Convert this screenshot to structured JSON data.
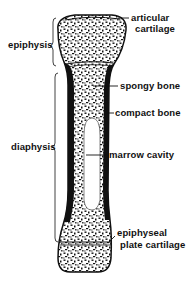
{
  "diagram": {
    "title": "",
    "colors": {
      "ink": "#111111",
      "background": "#ffffff"
    },
    "left_labels": [
      {
        "id": "epiphysis",
        "text": "epiphysis"
      },
      {
        "id": "diaphysis",
        "text": "diaphysis"
      }
    ],
    "right_labels": {
      "articular_1": "articular",
      "articular_2": "cartilage",
      "spongy": "spongy bone",
      "compact": "compact bone",
      "marrow": "marrow cavity",
      "plate_1": "epiphyseal",
      "plate_2": "plate cartilage"
    }
  }
}
